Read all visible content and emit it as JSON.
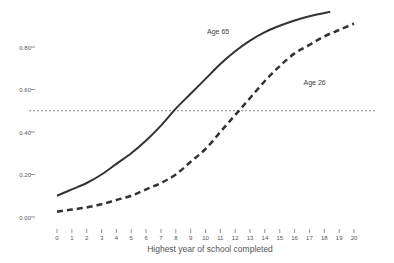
{
  "chart_data": {
    "type": "line",
    "title": "",
    "xlabel": "Highest year of school completed",
    "ylabel": "",
    "x_ticks": [
      0,
      1,
      2,
      3,
      4,
      5,
      6,
      7,
      8,
      9,
      10,
      11,
      12,
      13,
      14,
      15,
      16,
      17,
      18,
      19,
      20
    ],
    "y_ticks": [
      "0.00",
      "0.20",
      "0.40",
      "0.60",
      "0.80"
    ],
    "y_tick_values": [
      0.0,
      0.2,
      0.4,
      0.6,
      0.8
    ],
    "xlim": [
      0,
      20
    ],
    "ylim": [
      0,
      1.0
    ],
    "grid": false,
    "reference_line": {
      "y": 0.5,
      "style": "dotted"
    },
    "series": [
      {
        "name": "Age 65",
        "style": "solid",
        "x": [
          0,
          1,
          2,
          3,
          4,
          5,
          6,
          7,
          8,
          9,
          10,
          11,
          12,
          13,
          14,
          15,
          16,
          17,
          18,
          18.4
        ],
        "values": [
          0.1,
          0.13,
          0.16,
          0.2,
          0.25,
          0.3,
          0.36,
          0.43,
          0.51,
          0.58,
          0.65,
          0.72,
          0.78,
          0.83,
          0.87,
          0.9,
          0.925,
          0.945,
          0.96,
          0.965
        ]
      },
      {
        "name": "Age 26",
        "style": "dashed",
        "x": [
          0,
          1,
          2,
          3,
          4,
          5,
          6,
          7,
          8,
          9,
          10,
          11,
          12,
          13,
          14,
          15,
          16,
          17,
          18,
          19,
          20
        ],
        "values": [
          0.025,
          0.035,
          0.045,
          0.06,
          0.08,
          0.1,
          0.13,
          0.16,
          0.2,
          0.26,
          0.32,
          0.4,
          0.48,
          0.56,
          0.64,
          0.71,
          0.77,
          0.81,
          0.85,
          0.88,
          0.91
        ]
      }
    ],
    "annotations": [
      {
        "text": "Age 65",
        "x": 10.1,
        "y": 0.86
      },
      {
        "text": "Age 26",
        "x": 16.6,
        "y": 0.62
      }
    ]
  }
}
